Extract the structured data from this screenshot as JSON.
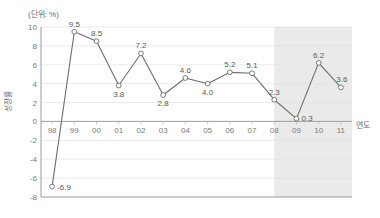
{
  "chart_data": {
    "type": "line",
    "title": "",
    "unit_note": "(단위: %)",
    "xlabel": "연도",
    "ylabel": "성장률",
    "categories": [
      "98",
      "99",
      "00",
      "01",
      "02",
      "03",
      "04",
      "05",
      "06",
      "07",
      "08",
      "09",
      "10",
      "11"
    ],
    "values": [
      -6.9,
      9.5,
      8.5,
      3.8,
      7.2,
      2.8,
      4.6,
      4.0,
      5.2,
      5.1,
      2.3,
      0.3,
      6.2,
      3.6
    ],
    "point_labels": [
      "-6.9",
      "9.5",
      "8.5",
      "3.8",
      "7.2",
      "2.8",
      "4.6",
      "4.0",
      "5.2",
      "5.1",
      "2.3",
      "0.3",
      "6.2",
      "3.6"
    ],
    "ylim": [
      -8,
      10
    ],
    "ytick_labels": [
      "10",
      "8",
      "6",
      "4",
      "2",
      "0",
      "-2",
      "-4",
      "-6",
      "-8"
    ],
    "yticks": [
      10,
      8,
      6,
      4,
      2,
      0,
      -2,
      -4,
      -6,
      -8
    ],
    "grid": true,
    "legend": "none",
    "shaded_region": {
      "from_category": "08",
      "to_category": "11",
      "color": "#e6e6e6"
    },
    "colors": {
      "line": "#6d6d6d",
      "marker_fill": "#ffffff",
      "grid": "#e2e2e2",
      "axis": "#9a9a9a",
      "shade": "#e6e6e6"
    }
  }
}
